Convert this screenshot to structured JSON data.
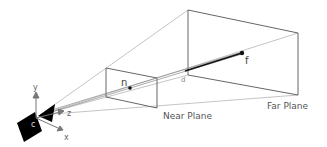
{
  "diagram": {
    "labels": {
      "near_plane": "Near Plane",
      "far_plane": "Far Plane",
      "point_near": "n",
      "point_far": "f",
      "distance": "d",
      "camera_center": "c",
      "axis_x": "x",
      "axis_y": "y",
      "axis_z": "z"
    },
    "colors": {
      "frame_lines": "#666666",
      "ray_lines": "#999999",
      "camera": "#000000",
      "text": "#555555"
    }
  }
}
